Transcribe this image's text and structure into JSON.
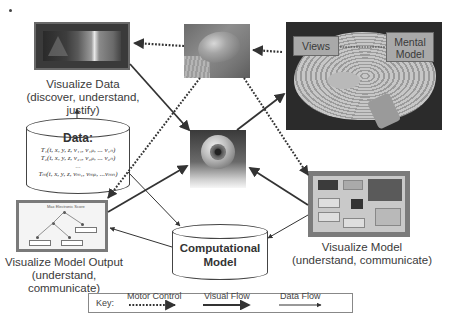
{
  "diagram": {
    "nodes": {
      "visualize_data": {
        "title": "Visualize Data",
        "subtitle": "(discover, understand, justify)"
      },
      "data_store": {
        "title": "Data:",
        "rows": [
          "T₁(t, x, y, z, v₁₁, v₁ₚ, ... v₁ₙ)",
          "T₂(t, x, y, z, v₂₁, v₂ₚ, ... v₂ₙ)",
          "...",
          "Tₘ(t, x, y, z, vₘ₁, vₘₚ, ...vₘₙ)"
        ]
      },
      "visualize_model_output": {
        "title": "Visualize Model Output",
        "subtitle": "(understand, communicate)",
        "screenshot_title": "Max Electronic Score"
      },
      "mouse": {
        "icon": "computer-mouse-photo"
      },
      "brain": {
        "views_label": "Views",
        "mental_model_label_1": "Mental",
        "mental_model_label_2": "Model"
      },
      "eye": {
        "icon": "eyeball-photo"
      },
      "visualize_model": {
        "title": "Visualize Model",
        "subtitle": "(understand, communicate)"
      },
      "computational_model": {
        "title_line1": "Computational",
        "title_line2": "Model"
      }
    },
    "key": {
      "label": "Key:",
      "motor_control": "Motor Control",
      "visual_flow": "Visual Flow",
      "data_flow": "Data Flow"
    },
    "colors": {
      "line": "#333333",
      "box_border": "#444444",
      "text": "#3a3a3a",
      "background": "#ffffff"
    }
  }
}
